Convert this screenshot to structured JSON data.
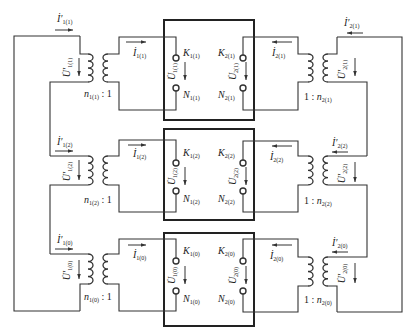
{
  "sections": [
    {
      "index": "1",
      "sub": "1(1)",
      "sub2": "2(1)",
      "primary_left": {
        "current": "İ′",
        "current_sub": "1(1)",
        "voltage": "U̇′",
        "voltage_sub": "1(1)"
      },
      "secondary_left": {
        "current": "İ",
        "current_sub": "1(1)",
        "ratio_n": "n",
        "ratio_sub": "1(1)",
        "ratio_rest": " : 1"
      },
      "box": {
        "k_left": "K",
        "k_left_sub": "1(1)",
        "n_left": "N",
        "n_left_sub": "1(1)",
        "u_left": "U̇",
        "u_left_sub": "1(1)",
        "k_right": "K",
        "k_right_sub": "2(1)",
        "n_right": "N",
        "n_right_sub": "2(1)",
        "u_right": "U̇",
        "u_right_sub": "2(1)"
      },
      "secondary_right": {
        "current": "İ",
        "current_sub": "2(1)",
        "ratio_pre": "1 : ",
        "ratio_n": "n",
        "ratio_sub": "2(1)"
      },
      "primary_right": {
        "current": "İ′",
        "current_sub": "2(1)",
        "voltage": "U̇′",
        "voltage_sub": "2(1)"
      }
    },
    {
      "index": "2",
      "primary_left": {
        "current": "İ′",
        "current_sub": "1(2)",
        "voltage": "U̇′",
        "voltage_sub": "1(2)"
      },
      "secondary_left": {
        "current": "İ",
        "current_sub": "1(2)",
        "ratio_n": "n",
        "ratio_sub": "1(2)",
        "ratio_rest": " : 1"
      },
      "box": {
        "k_left": "K",
        "k_left_sub": "1(2)",
        "n_left": "N",
        "n_left_sub": "1(2)",
        "u_left": "U̇",
        "u_left_sub": "1(2)",
        "k_right": "K",
        "k_right_sub": "2(2)",
        "n_right": "N",
        "n_right_sub": "2(2)",
        "u_right": "U̇",
        "u_right_sub": "2(2)"
      },
      "secondary_right": {
        "current": "İ",
        "current_sub": "2(2)",
        "ratio_pre": "1 : ",
        "ratio_n": "n",
        "ratio_sub": "2(2)"
      },
      "primary_right": {
        "current": "İ′",
        "current_sub": "2(2)",
        "voltage": "U̇′",
        "voltage_sub": "2(2)"
      }
    },
    {
      "index": "0",
      "primary_left": {
        "current": "İ′",
        "current_sub": "1(0)",
        "voltage": "U̇′",
        "voltage_sub": "1(0)"
      },
      "secondary_left": {
        "current": "İ",
        "current_sub": "1(0)",
        "ratio_n": "n",
        "ratio_sub": "1(0)",
        "ratio_rest": " : 1"
      },
      "box": {
        "k_left": "K",
        "k_left_sub": "1(0)",
        "n_left": "N",
        "n_left_sub": "1(0)",
        "u_left": "U̇",
        "u_left_sub": "1(0)",
        "k_right": "K",
        "k_right_sub": "2(0)",
        "n_right": "N",
        "n_right_sub": "2(0)",
        "u_right": "U̇",
        "u_right_sub": "2(0)"
      },
      "secondary_right": {
        "current": "İ",
        "current_sub": "2(0)",
        "ratio_pre": "1 : ",
        "ratio_n": "n",
        "ratio_sub": "2(0)"
      },
      "primary_right": {
        "current": "İ′",
        "current_sub": "2(0)",
        "voltage": "U̇′",
        "voltage_sub": "2(0)"
      }
    }
  ],
  "colors": {
    "line": "#333333",
    "box": "#222222",
    "background": "#ffffff"
  }
}
